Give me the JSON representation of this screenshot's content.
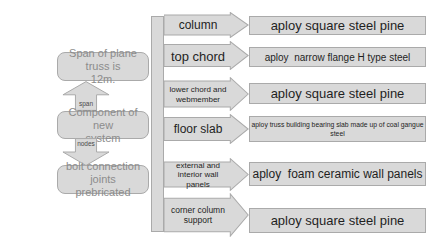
{
  "diagram": {
    "left_flow": {
      "boxes": [
        {
          "label": "Span of plane truss is\n12m."
        },
        {
          "label": "Component of new\nsystem"
        },
        {
          "label": "bolt connection joints\nprebricated"
        }
      ],
      "connectors": [
        {
          "label": "span",
          "direction": "up"
        },
        {
          "label": "nodes",
          "direction": "down"
        }
      ]
    },
    "rows": [
      {
        "component": "column",
        "material": "aploy square steel pine"
      },
      {
        "component": "top chord",
        "material": "aploy  narrow flange H type steel"
      },
      {
        "component": "lower chord and\nwebmember",
        "material": "aploy square steel pine"
      },
      {
        "component": "floor slab",
        "material": "aploy truss building bearing slab made up of coal gangue\nsteel"
      },
      {
        "component": "external and\ninterior wall panels",
        "material": "aploy  foam ceramic wall panels"
      },
      {
        "component": "corner column\nsupport",
        "material": "aploy square steel pine"
      }
    ],
    "colors": {
      "background": "#ffffff",
      "shape_fill": "#d9d9d9",
      "shape_border": "#aaaaaa",
      "left_text": "#8c8c8c",
      "dark_text": "#1f1f1f",
      "connector_label": "#4a4a4a"
    }
  }
}
